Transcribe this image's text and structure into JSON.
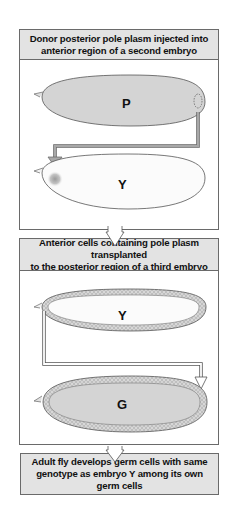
{
  "steps": [
    {
      "text_line1": "Donor posterior pole plasm injected into",
      "text_line2": "anterior region of a second embryo"
    },
    {
      "text_line1": "Anterior cells containing pole plasm transplanted",
      "text_line2": "to the posterior region of a third embryo"
    },
    {
      "text_line1": "Adult fly develops germ cells with same",
      "text_line2": "genotype as embryo Y among its own",
      "text_line3": "germ cells"
    }
  ],
  "embryos": {
    "donor": {
      "label": "P"
    },
    "second": {
      "label": "Y"
    },
    "third_source": {
      "label": "Y"
    },
    "recipient": {
      "label": "G"
    }
  },
  "colors": {
    "header_fill": "#e3e3e3",
    "donor_fill": "#d4d4d4",
    "white_embryo": "#fbfbfb",
    "arrow_fill": "#a8a8a8",
    "border": "#6a6a6a"
  }
}
